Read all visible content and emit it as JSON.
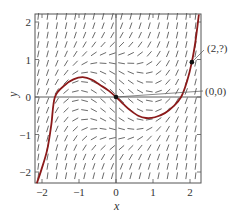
{
  "figure": {
    "xlabel": "x",
    "ylabel": "y",
    "xlim": [
      -2.2,
      2.3
    ],
    "ylim": [
      -2.3,
      2.2
    ],
    "x_ticks": [
      {
        "value": -2,
        "label": "−2"
      },
      {
        "value": -1,
        "label": "−1"
      },
      {
        "value": 0,
        "label": "0"
      },
      {
        "value": 1,
        "label": "1"
      },
      {
        "value": 2,
        "label": "2"
      }
    ],
    "y_ticks": [
      {
        "value": -2,
        "label": "−2"
      },
      {
        "value": -1,
        "label": "−1"
      },
      {
        "value": 0,
        "label": "0"
      },
      {
        "value": 1,
        "label": "1"
      },
      {
        "value": 2,
        "label": "2"
      }
    ],
    "colors": {
      "frame": "#555555",
      "axes": "#333333",
      "slope_marks": "#444444",
      "curve": "#8b1a1a",
      "points": "#111111",
      "leader": "#555555"
    }
  },
  "slope_field": {
    "equation": "dy/dx = x^2 + y^2 - 1",
    "grid_start": -2.1,
    "grid_step": 0.25,
    "x_count": 18,
    "y_count": 18,
    "mark_half_length_px": 3.4
  },
  "solution_curve": {
    "label": "solution through (0,0)",
    "points": [
      [
        -2.14,
        -2.3
      ],
      [
        -2.02,
        -1.95
      ],
      [
        -1.86,
        -1.41
      ],
      [
        -1.75,
        -0.75
      ],
      [
        -1.65,
        0.0
      ],
      [
        -1.38,
        0.32
      ],
      [
        -1.15,
        0.47
      ],
      [
        -0.9,
        0.53
      ],
      [
        -0.65,
        0.46
      ],
      [
        -0.43,
        0.32
      ],
      [
        -0.2,
        0.17
      ],
      [
        0.0,
        0.0
      ],
      [
        0.2,
        -0.19
      ],
      [
        0.38,
        -0.35
      ],
      [
        0.6,
        -0.5
      ],
      [
        0.81,
        -0.56
      ],
      [
        1.05,
        -0.54
      ],
      [
        1.32,
        -0.43
      ],
      [
        1.55,
        -0.25
      ],
      [
        1.76,
        0.0
      ],
      [
        1.92,
        0.42
      ],
      [
        2.05,
        0.93
      ],
      [
        2.15,
        1.5
      ],
      [
        2.24,
        2.2
      ]
    ]
  },
  "annotations": [
    {
      "label": "(2,?)",
      "point": [
        2.05,
        0.93
      ],
      "text_px": [
        207,
        52
      ],
      "leader_to_px": [
        204,
        50
      ]
    },
    {
      "label": "(0,0)",
      "point": [
        0.0,
        0.0
      ],
      "text_px": [
        205,
        95
      ],
      "leader_to_px": [
        203,
        91
      ]
    }
  ]
}
